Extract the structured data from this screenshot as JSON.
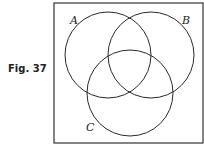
{
  "figure": {
    "label": "Fig. 37"
  },
  "diagram": {
    "type": "venn",
    "universe_box": {
      "x": 54,
      "y": 3,
      "width": 149,
      "height": 140,
      "stroke": "#333333"
    },
    "sets": [
      {
        "name": "A",
        "cx": 108,
        "cy": 55,
        "r": 43,
        "label_x": 70,
        "label_y": 24
      },
      {
        "name": "B",
        "cx": 151,
        "cy": 55,
        "r": 43,
        "label_x": 182,
        "label_y": 24
      },
      {
        "name": "C",
        "cx": 130,
        "cy": 93,
        "r": 43,
        "label_x": 86,
        "label_y": 131
      }
    ],
    "stroke_color": "#2a2a2a"
  }
}
